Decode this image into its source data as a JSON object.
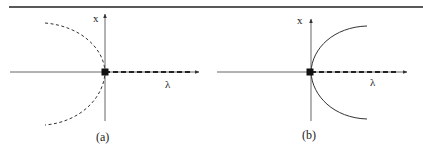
{
  "figure": {
    "panels": [
      {
        "id": "a",
        "caption": "(a)",
        "y_axis_label": "x",
        "x_axis_label": "λ",
        "curve_style": "dashed",
        "curve_direction": "left",
        "branch_on_axis": "dashed"
      },
      {
        "id": "b",
        "caption": "(b)",
        "y_axis_label": "x",
        "x_axis_label": "λ",
        "curve_style": "solid",
        "curve_direction": "right",
        "branch_on_axis": "dashed"
      }
    ],
    "colors": {
      "axis": "#555555",
      "curve": "#333333",
      "marker": "#111111",
      "rule": "#222222"
    }
  }
}
